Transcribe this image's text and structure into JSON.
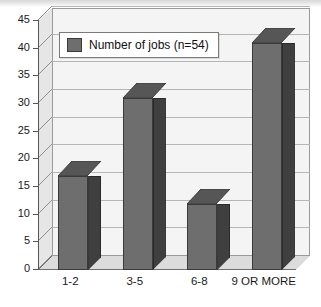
{
  "chart_data": {
    "type": "bar",
    "title": "",
    "subtitle": "",
    "xlabel": "",
    "ylabel": "",
    "categories": [
      "1-2",
      "3-5",
      "6-8",
      "9 OR MORE"
    ],
    "values": [
      17,
      31,
      12,
      41
    ],
    "series": [
      {
        "name": "Number of jobs (n=54)",
        "values": [
          17,
          31,
          12,
          41
        ]
      }
    ],
    "legend": {
      "position": "top-left",
      "entries": [
        "Number of jobs (n=54)"
      ]
    },
    "ylim": [
      0,
      45
    ],
    "ytick_step": 5,
    "yticks": [
      45,
      40,
      35,
      30,
      25,
      20,
      15,
      10,
      5,
      0
    ],
    "grid": true,
    "style": "3d-column",
    "colors": {
      "bar_front": "#6e6e6e",
      "bar_side": "#3f3f3f",
      "bar_top": "#565656",
      "bar_outline": "#3a3a3a",
      "plot_background": "#f4f4f4",
      "gridline": "#b5b5b5",
      "axis": "#555555",
      "floor": "#dcdcdc",
      "side_wall": "#e6e6e6",
      "text": "#1a1a1a",
      "legend_background": "#ffffff",
      "legend_border": "#7a7a7a"
    }
  }
}
